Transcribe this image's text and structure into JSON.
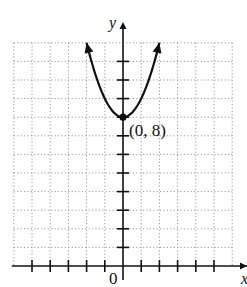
{
  "chart_data": {
    "type": "line",
    "title": "",
    "xlabel": "x",
    "ylabel": "y",
    "xlim": [
      -6,
      6
    ],
    "ylim": [
      0,
      12
    ],
    "grid": true,
    "grid_style": "dotted",
    "origin_label": "0",
    "series": [
      {
        "name": "parabola",
        "equation": "y = x^2 + 8",
        "x": [
          -2,
          -1.5,
          -1,
          -0.5,
          0,
          0.5,
          1,
          1.5,
          2
        ],
        "y": [
          12,
          10.25,
          9,
          8.25,
          8,
          8.25,
          9,
          10.25,
          12
        ],
        "arrows_at_ends": true
      }
    ],
    "annotations": [
      {
        "point": [
          0,
          8
        ],
        "label": "(0, 8)",
        "marker": "filled-circle"
      }
    ],
    "x_ticks": [
      -5,
      -4,
      -3,
      -2,
      -1,
      1,
      2,
      3,
      4,
      5
    ],
    "y_ticks": [
      1,
      2,
      3,
      4,
      5,
      6,
      7,
      8,
      9,
      10,
      11
    ]
  },
  "labels": {
    "x_axis": "x",
    "y_axis": "y",
    "origin": "0",
    "vertex": "(0, 8)"
  },
  "colors": {
    "axis": "#111111",
    "grid": "#9a9a9a",
    "curve": "#111111"
  }
}
